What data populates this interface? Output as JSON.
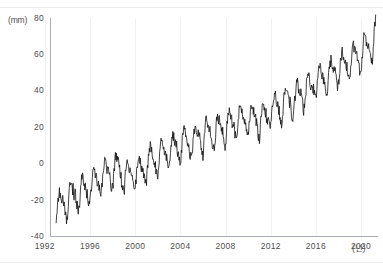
{
  "figure": {
    "y_unit_label": "(mm)",
    "x_unit_label": "(년)",
    "caption_tag": "",
    "caption_text": ""
  },
  "chart_data": {
    "type": "line",
    "title": "",
    "subtitle": "",
    "xlabel": "(년)",
    "ylabel": "(mm)",
    "xlim": [
      1992.5,
      2021.5
    ],
    "ylim": [
      -40,
      80
    ],
    "grid": true,
    "grid_style": "faint vertical gridlines at 4-year ticks",
    "legend": null,
    "legend_position": "none",
    "line_color": "#111111",
    "line_width": 0.8,
    "axis_color": "#9aa0a6",
    "y_ticks": [
      80,
      60,
      40,
      20,
      0,
      -20,
      -40
    ],
    "y_tick_labels": [
      "80",
      "60",
      "40",
      "20",
      "0",
      "-20",
      "-40"
    ],
    "x_ticks": [
      1992,
      1996,
      2000,
      2004,
      2008,
      2012,
      2016,
      2020
    ],
    "x_tick_labels": [
      "1992",
      "1996",
      "2000",
      "2004",
      "2008",
      "2012",
      "2016",
      "2020"
    ],
    "series_name": "Global mean sea level anomaly",
    "trend_mm_per_year": 3.35,
    "seasonal_amplitude_mm": 6.5,
    "annotation": "Monthly satellite-altimetry sea level anomaly, 1993-2021, rising trend with annual cycle",
    "x_start": 1993.0,
    "x_end": 2021.3,
    "samples_per_year": 24,
    "noise_amplitude_mm": 3.2,
    "y_start_approx": -26,
    "y_end_approx": 72,
    "x": [
      1993.0,
      1993.5,
      1994.0,
      1994.5,
      1995.0,
      1995.5,
      1996.0,
      1996.5,
      1997.0,
      1997.5,
      1998.0,
      1998.5,
      1999.0,
      1999.5,
      2000.0,
      2000.5,
      2001.0,
      2001.5,
      2002.0,
      2002.5,
      2003.0,
      2003.5,
      2004.0,
      2004.5,
      2005.0,
      2005.5,
      2006.0,
      2006.5,
      2007.0,
      2007.5,
      2008.0,
      2008.5,
      2009.0,
      2009.5,
      2010.0,
      2010.5,
      2011.0,
      2011.5,
      2012.0,
      2012.5,
      2013.0,
      2013.5,
      2014.0,
      2014.5,
      2015.0,
      2015.5,
      2016.0,
      2016.5,
      2017.0,
      2017.5,
      2018.0,
      2018.5,
      2019.0,
      2019.5,
      2020.0,
      2020.5,
      2021.0,
      2021.3
    ],
    "values": [
      -26.0,
      -21.5,
      -21.0,
      -16.5,
      -18.0,
      -13.0,
      -14.5,
      -9.0,
      -8.5,
      -4.0,
      -6.0,
      -1.0,
      -9.0,
      -5.0,
      -6.5,
      -2.0,
      -2.0,
      3.0,
      2.0,
      7.0,
      5.5,
      10.0,
      8.5,
      13.0,
      10.0,
      15.5,
      13.0,
      18.5,
      15.0,
      20.0,
      18.0,
      23.0,
      20.0,
      25.5,
      22.5,
      27.0,
      21.0,
      26.0,
      27.0,
      32.0,
      30.0,
      35.5,
      33.0,
      38.5,
      38.0,
      43.0,
      44.0,
      49.0,
      46.0,
      51.5,
      50.0,
      55.5,
      54.0,
      59.5,
      58.0,
      64.0,
      64.0,
      72.0
    ]
  }
}
